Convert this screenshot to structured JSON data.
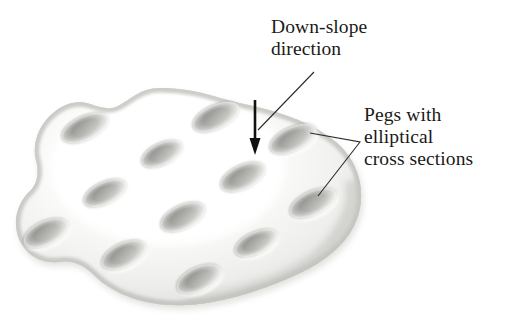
{
  "figure": {
    "background_color": "#ffffff",
    "ink_color": "#1a1a18",
    "surface": {
      "name": "blob-surface",
      "fill_light": "#ffffff",
      "fill_mid": "#f0f0ee",
      "fill_shadow": "#c9c9c5",
      "edge_shadow": "#a8a8a4"
    },
    "peg": {
      "fill_dark": "#8e8e8a",
      "fill_mid": "#b6b6b2",
      "fill_light": "#e2e2de",
      "rotation_deg": -25,
      "count": 12
    }
  },
  "annotations": {
    "downslope": {
      "name": "down-slope-label",
      "lines": [
        "Down-slope",
        "direction"
      ],
      "line1": "Down-slope",
      "line2": "direction"
    },
    "pegs": {
      "name": "pegs-label",
      "lines": [
        "Pegs with",
        "elliptical",
        "cross sections"
      ],
      "line1": "Pegs with",
      "line2": "elliptical",
      "line3": "cross sections"
    },
    "arrow": {
      "name": "down-slope-arrow",
      "direction": "down",
      "x": 255,
      "y_start": 100,
      "y_end": 155
    }
  },
  "chart_data": {
    "type": "diagram",
    "pegs": [
      {
        "id": 1,
        "cx": 85,
        "cy": 128,
        "rx": 25,
        "ry": 12
      },
      {
        "id": 2,
        "cx": 216,
        "cy": 117,
        "rx": 25,
        "ry": 12
      },
      {
        "id": 3,
        "cx": 162,
        "cy": 154,
        "rx": 22,
        "ry": 11
      },
      {
        "id": 4,
        "cx": 293,
        "cy": 139,
        "rx": 25,
        "ry": 12
      },
      {
        "id": 5,
        "cx": 243,
        "cy": 177,
        "rx": 24,
        "ry": 12
      },
      {
        "id": 6,
        "cx": 105,
        "cy": 193,
        "rx": 23,
        "ry": 11
      },
      {
        "id": 7,
        "cx": 313,
        "cy": 203,
        "rx": 25,
        "ry": 12
      },
      {
        "id": 8,
        "cx": 183,
        "cy": 217,
        "rx": 24,
        "ry": 12
      },
      {
        "id": 9,
        "cx": 46,
        "cy": 233,
        "rx": 24,
        "ry": 12
      },
      {
        "id": 10,
        "cx": 256,
        "cy": 243,
        "rx": 23,
        "ry": 11
      },
      {
        "id": 11,
        "cx": 124,
        "cy": 255,
        "rx": 24,
        "ry": 12
      },
      {
        "id": 12,
        "cx": 199,
        "cy": 279,
        "rx": 24,
        "ry": 12
      }
    ],
    "leader_lines": [
      {
        "name": "downslope-leader",
        "from": [
          314,
          72
        ],
        "to": [
          258,
          130
        ]
      },
      {
        "name": "pegs-leader-upper",
        "from": [
          360,
          142
        ],
        "to": [
          310,
          133
        ]
      },
      {
        "name": "pegs-leader-lower",
        "from": [
          360,
          142
        ],
        "to": [
          318,
          196
        ]
      }
    ]
  }
}
